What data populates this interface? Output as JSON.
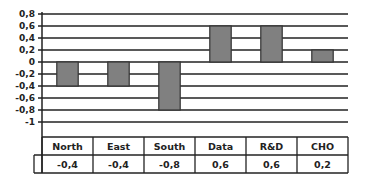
{
  "chart_data": {
    "type": "bar",
    "title": "",
    "xlabel": "",
    "ylabel": "",
    "categories": [
      "North",
      "East",
      "South",
      "Data",
      "R&D",
      "CHO"
    ],
    "values": [
      -0.4,
      -0.4,
      -0.8,
      0.6,
      0.6,
      0.2
    ],
    "value_labels": [
      "-0,4",
      "-0,4",
      "-0,8",
      "0,6",
      "0,6",
      "0,2"
    ],
    "ylim": [
      -1,
      0.8
    ],
    "yticks": [
      0.8,
      0.6,
      0.4,
      0.2,
      0,
      -0.2,
      -0.4,
      -0.6,
      -0.8,
      -1
    ],
    "ytick_labels": [
      "0,8",
      "0,6",
      "0,4",
      "0,2",
      "0",
      "-0,2",
      "-0,4",
      "-0,6",
      "-0,8",
      "-1"
    ],
    "grid": true,
    "legend": "none",
    "data_table": true,
    "bar_color": "#808080"
  }
}
